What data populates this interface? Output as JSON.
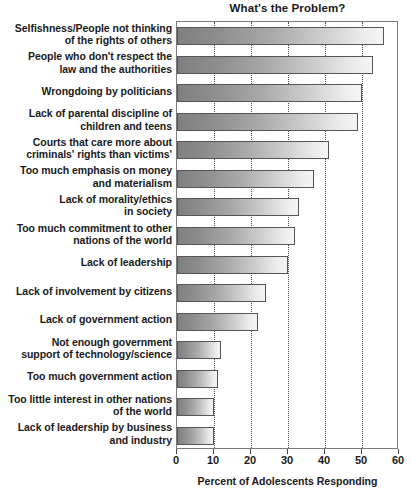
{
  "chart_data": {
    "type": "bar",
    "orientation": "horizontal",
    "title": "What's the Problem?",
    "xlabel": "Percent of Adolescents Responding",
    "ylabel": "",
    "xlim": [
      0,
      60
    ],
    "xticks": [
      0,
      10,
      20,
      30,
      40,
      50,
      60
    ],
    "xtick_labels": [
      "0",
      "10",
      "20",
      "30",
      "40",
      "50",
      "60"
    ],
    "grid": "vertical dotted gridlines at 10,20,30,40,50",
    "legend": "none",
    "categories": [
      "Selfishness/People not thinking of the rights of others",
      "People who don't respect the law and the authorities",
      "Wrongdoing by politicians",
      "Lack of parental discipline of children and teens",
      "Courts that care more about criminals' rights than victims'",
      "Too much emphasis on money and materialism",
      "Lack of morality/ethics in society",
      "Too much commitment to other nations of the world",
      "Lack of leadership",
      "Lack of involvement by citizens",
      "Lack of government action",
      "Not enough government support of technology/science",
      "Too much government action",
      "Too little interest in other nations of the world",
      "Lack of leadership by business and industry"
    ],
    "category_lines": [
      [
        "Selfishness/People not thinking",
        "of the rights of others"
      ],
      [
        "People who don't respect the",
        "law and the authorities"
      ],
      [
        "Wrongdoing by politicians"
      ],
      [
        "Lack of parental discipline of",
        "children and teens"
      ],
      [
        "Courts that care more about",
        "criminals' rights than victims'"
      ],
      [
        "Too much emphasis on money",
        "and materialism"
      ],
      [
        "Lack of morality/ethics",
        "in society"
      ],
      [
        "Too much commitment to other",
        "nations of the world"
      ],
      [
        "Lack of leadership"
      ],
      [
        "Lack of involvement by citizens"
      ],
      [
        "Lack of government action"
      ],
      [
        "Not enough government",
        "support of technology/science"
      ],
      [
        "Too much government action"
      ],
      [
        "Too little interest in other nations",
        "of the world"
      ],
      [
        "Lack of leadership by business",
        "and industry"
      ]
    ],
    "values": [
      56,
      53,
      50,
      49,
      41,
      37,
      33,
      32,
      30,
      24,
      22,
      12,
      11,
      10,
      10
    ]
  },
  "colors": {
    "bar_dark": "#808080",
    "bar_light": "#f4f4f4",
    "bar_border": "#555555",
    "frame": "#7a7a7a",
    "gridline": "#4a4a4a",
    "text": "#1a1a1a",
    "background": "#ffffff"
  }
}
